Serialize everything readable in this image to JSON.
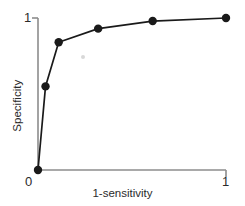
{
  "chart_data": {
    "type": "line",
    "title": "",
    "subtitle": "",
    "xlabel": "1-sensitivity",
    "ylabel": "Specificity",
    "xlim": [
      0,
      1
    ],
    "ylim": [
      0,
      1
    ],
    "xticks": [
      0,
      1
    ],
    "xticklabels": [
      "0",
      "1"
    ],
    "yticks": [
      0,
      1
    ],
    "yticklabels": [
      "0",
      "1"
    ],
    "grid": false,
    "legend": false,
    "marker": "filled-circle",
    "line_color": "#1a1a1a",
    "marker_color": "#1a1a1a",
    "axis_color": "#8c8c8c",
    "series": [
      {
        "name": "ROC curve",
        "x": [
          0.0,
          0.04,
          0.11,
          0.32,
          0.61,
          1.0
        ],
        "y": [
          0.0,
          0.55,
          0.84,
          0.93,
          0.98,
          1.0
        ]
      }
    ]
  },
  "axis": {
    "y_tick_top_label": "1",
    "x_tick_zero_label": "0",
    "x_tick_one_label": "1",
    "x_title": "1-sensitivity",
    "y_title": "Specificity"
  }
}
